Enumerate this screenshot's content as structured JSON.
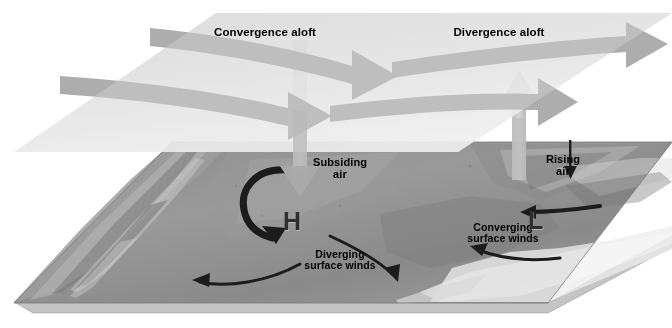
{
  "figure": {
    "type": "meteorology-schematic",
    "background_color": "#ffffff"
  },
  "upper_plane": {
    "name": "upper-level-plane",
    "fill_color": "#dcdcdc",
    "labels": {
      "convergence": "Convergence aloft",
      "divergence": "Divergence aloft"
    },
    "flow_arrows": [
      {
        "id": "convergence-arrow-upper",
        "direction": "rightward",
        "color": "#a8a8a8"
      },
      {
        "id": "convergence-arrow-lower",
        "direction": "rightward",
        "color": "#a8a8a8"
      },
      {
        "id": "divergence-arrow-upper",
        "direction": "rightward",
        "color": "#a8a8a8"
      },
      {
        "id": "divergence-arrow-lower",
        "direction": "rightward",
        "color": "#a8a8a8"
      }
    ]
  },
  "surface_plane": {
    "name": "terrain-surface-block",
    "fill_color": "#8e8e8e",
    "edge_color": "#c9c9c9"
  },
  "vertical_arrows": [
    {
      "id": "subsiding-air-arrow",
      "direction": "down",
      "label": "Subsiding\nair",
      "color": "#b4b4b4"
    },
    {
      "id": "rising-air-arrow",
      "direction": "up",
      "label": "Rising\nair",
      "color": "#b4b4b4"
    }
  ],
  "pressure_centers": [
    {
      "id": "high-pressure-center",
      "symbol": "H",
      "meaning": "high pressure"
    },
    {
      "id": "low-pressure-center",
      "symbol": "L",
      "meaning": "low pressure"
    }
  ],
  "surface_winds": {
    "diverging_label": "Diverging\nsurface winds",
    "converging_label": "Converging\nsurface winds",
    "arc_color": "#1f1f1f"
  },
  "labels_flat": {
    "convergence_aloft": "Convergence aloft",
    "divergence_aloft": "Divergence aloft",
    "subsiding_air": "Subsiding\nair",
    "rising_air": "Rising\nair",
    "diverging_surface_winds": "Diverging\nsurface winds",
    "converging_surface_winds": "Converging\nsurface winds",
    "h_symbol": "H",
    "l_symbol": "L"
  }
}
